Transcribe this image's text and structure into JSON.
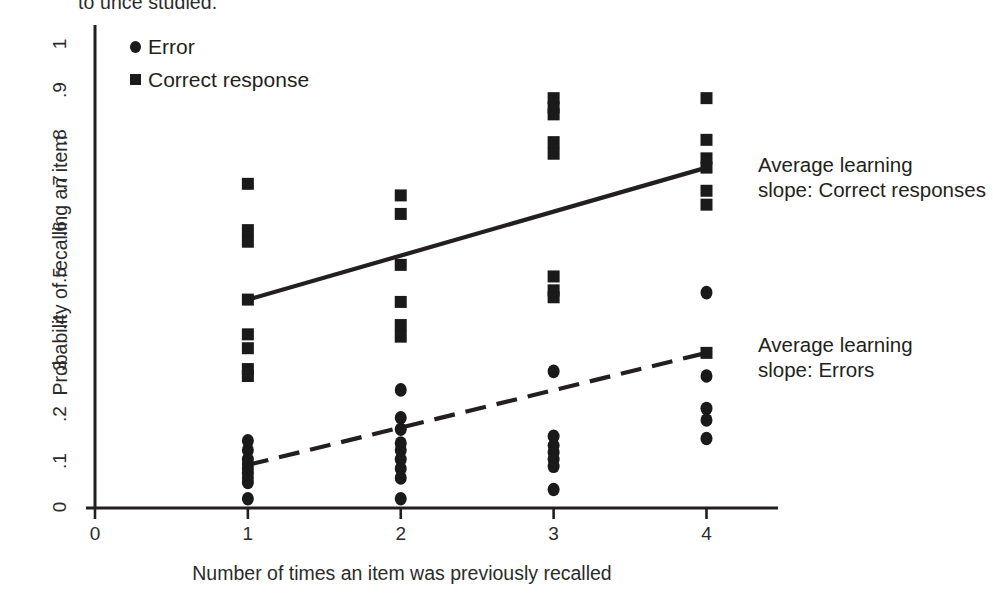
{
  "figure": {
    "truncated_caption": "to unce studied.",
    "legend": [
      {
        "label": "Error",
        "marker": "circle"
      },
      {
        "label": "Correct response",
        "marker": "square"
      }
    ],
    "annotations": {
      "correct_line1": "Average learning",
      "correct_line2": "slope: Correct responses",
      "errors_line1": "Average learning",
      "errors_line2": "slope: Errors"
    },
    "colors": {
      "marker": "#1a1a1a",
      "axis": "#231f20",
      "text": "#231f20",
      "background": "#ffffff"
    }
  },
  "chart_data": {
    "type": "scatter",
    "title": "",
    "subtitle": "",
    "xlabel": "Number of times an item was previously recalled",
    "ylabel": "Probability of recalling an item",
    "xlim": [
      0,
      4.35
    ],
    "ylim": [
      0,
      1.03
    ],
    "xticks": [
      0,
      1,
      2,
      3,
      4
    ],
    "xtick_labels": [
      "0",
      "1",
      "2",
      "3",
      "4"
    ],
    "yticks": [
      0,
      0.1,
      0.2,
      0.3,
      0.4,
      0.5,
      0.6,
      0.7,
      0.8,
      0.9,
      1
    ],
    "ytick_labels": [
      "0",
      ".1",
      ".2",
      ".3",
      ".4",
      ".5",
      ".6",
      ".7",
      ".8",
      ".9",
      "1"
    ],
    "grid": false,
    "legend_position": "top-left-inside",
    "series": [
      {
        "name": "Correct response",
        "marker": "square",
        "color": "#1a1a1a",
        "points": [
          {
            "x": 1,
            "y": 0.7
          },
          {
            "x": 1,
            "y": 0.6
          },
          {
            "x": 1,
            "y": 0.575
          },
          {
            "x": 1,
            "y": 0.45
          },
          {
            "x": 1,
            "y": 0.375
          },
          {
            "x": 1,
            "y": 0.345
          },
          {
            "x": 1,
            "y": 0.3
          },
          {
            "x": 1,
            "y": 0.285
          },
          {
            "x": 2,
            "y": 0.675
          },
          {
            "x": 2,
            "y": 0.635
          },
          {
            "x": 2,
            "y": 0.525
          },
          {
            "x": 2,
            "y": 0.445
          },
          {
            "x": 2,
            "y": 0.395
          },
          {
            "x": 2,
            "y": 0.37
          },
          {
            "x": 3,
            "y": 0.885
          },
          {
            "x": 3,
            "y": 0.865
          },
          {
            "x": 3,
            "y": 0.85
          },
          {
            "x": 3,
            "y": 0.79
          },
          {
            "x": 3,
            "y": 0.765
          },
          {
            "x": 3,
            "y": 0.5
          },
          {
            "x": 3,
            "y": 0.47
          },
          {
            "x": 3,
            "y": 0.455
          },
          {
            "x": 4,
            "y": 0.885
          },
          {
            "x": 4,
            "y": 0.795
          },
          {
            "x": 4,
            "y": 0.755
          },
          {
            "x": 4,
            "y": 0.735
          },
          {
            "x": 4,
            "y": 0.685
          },
          {
            "x": 4,
            "y": 0.655
          },
          {
            "x": 4,
            "y": 0.335
          }
        ]
      },
      {
        "name": "Error",
        "marker": "circle",
        "color": "#1a1a1a",
        "points": [
          {
            "x": 1,
            "y": 0.145
          },
          {
            "x": 1,
            "y": 0.125
          },
          {
            "x": 1,
            "y": 0.105
          },
          {
            "x": 1,
            "y": 0.095
          },
          {
            "x": 1,
            "y": 0.085
          },
          {
            "x": 1,
            "y": 0.075
          },
          {
            "x": 1,
            "y": 0.065
          },
          {
            "x": 1,
            "y": 0.055
          },
          {
            "x": 1,
            "y": 0.02
          },
          {
            "x": 2,
            "y": 0.255
          },
          {
            "x": 2,
            "y": 0.195
          },
          {
            "x": 2,
            "y": 0.17
          },
          {
            "x": 2,
            "y": 0.14
          },
          {
            "x": 2,
            "y": 0.125
          },
          {
            "x": 2,
            "y": 0.105
          },
          {
            "x": 2,
            "y": 0.085
          },
          {
            "x": 2,
            "y": 0.065
          },
          {
            "x": 2,
            "y": 0.02
          },
          {
            "x": 3,
            "y": 0.295
          },
          {
            "x": 3,
            "y": 0.155
          },
          {
            "x": 3,
            "y": 0.135
          },
          {
            "x": 3,
            "y": 0.12
          },
          {
            "x": 3,
            "y": 0.105
          },
          {
            "x": 3,
            "y": 0.09
          },
          {
            "x": 3,
            "y": 0.04
          },
          {
            "x": 4,
            "y": 0.465
          },
          {
            "x": 4,
            "y": 0.285
          },
          {
            "x": 4,
            "y": 0.215
          },
          {
            "x": 4,
            "y": 0.19
          },
          {
            "x": 4,
            "y": 0.15
          }
        ]
      }
    ],
    "trendlines": [
      {
        "name": "Average learning slope: Correct responses",
        "style": "solid",
        "x0": 1,
        "y0": 0.45,
        "x1": 4,
        "y1": 0.735
      },
      {
        "name": "Average learning slope: Errors",
        "style": "dashed",
        "x0": 1,
        "y0": 0.093,
        "x1": 4,
        "y1": 0.335
      }
    ]
  }
}
